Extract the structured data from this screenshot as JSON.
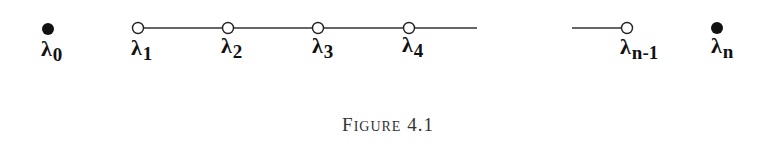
{
  "figure": {
    "caption": {
      "first_letter": "F",
      "rest": "IGURE",
      "number": "4.1"
    },
    "nodes": [
      {
        "id": "lambda_0",
        "symbol": "λ",
        "subscript": "0",
        "style": "filled",
        "x": 48
      },
      {
        "id": "lambda_1",
        "symbol": "λ",
        "subscript": "1",
        "style": "open",
        "x": 138
      },
      {
        "id": "lambda_2",
        "symbol": "λ",
        "subscript": "2",
        "style": "open",
        "x": 228
      },
      {
        "id": "lambda_3",
        "symbol": "λ",
        "subscript": "3",
        "style": "open",
        "x": 318
      },
      {
        "id": "lambda_4",
        "symbol": "λ",
        "subscript": "4",
        "style": "open",
        "x": 409
      },
      {
        "id": "lambda_n-1",
        "symbol": "λ",
        "subscript": "n-1",
        "style": "open",
        "x": 627
      },
      {
        "id": "lambda_n",
        "symbol": "λ",
        "subscript": "n",
        "style": "filled",
        "x": 717
      }
    ],
    "edges": [
      {
        "from_x": 138,
        "to_x": 477,
        "label": "chain λ1–λ4 continuing"
      },
      {
        "from_x": 572,
        "to_x": 627,
        "label": "segment into λn-1"
      }
    ]
  }
}
